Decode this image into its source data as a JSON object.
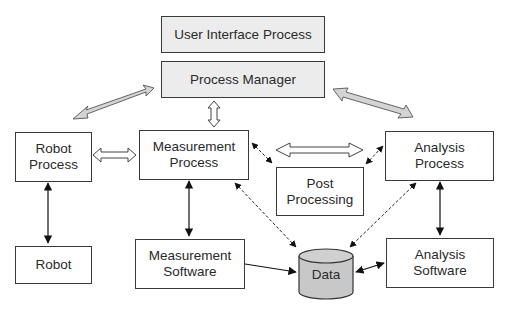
{
  "diagram": {
    "nodes": {
      "user_interface_process": "User Interface Process",
      "process_manager": "Process Manager",
      "robot_process": "Robot\nProcess",
      "measurement_process": "Measurement\nProcess",
      "post_processing": "Post\nProcessing",
      "analysis_process": "Analysis\nProcess",
      "robot": "Robot",
      "measurement_software": "Measurement\nSoftware",
      "analysis_software": "Analysis\nSoftware",
      "data": "Data"
    },
    "edges": [
      {
        "from": "process_manager",
        "to": "measurement_process",
        "style": "hollow-double-arrow"
      },
      {
        "from": "process_manager",
        "to": "robot_process",
        "style": "gray-double-arrow"
      },
      {
        "from": "process_manager",
        "to": "analysis_process",
        "style": "gray-double-arrow"
      },
      {
        "from": "robot_process",
        "to": "measurement_process",
        "style": "hollow-double-arrow"
      },
      {
        "from": "measurement_process",
        "to": "analysis_process",
        "style": "hollow-double-arrow"
      },
      {
        "from": "measurement_process",
        "to": "post_processing",
        "style": "dashed-bidirectional"
      },
      {
        "from": "post_processing",
        "to": "analysis_process",
        "style": "dashed-bidirectional"
      },
      {
        "from": "robot_process",
        "to": "robot",
        "style": "solid-bidirectional"
      },
      {
        "from": "measurement_process",
        "to": "measurement_software",
        "style": "solid-bidirectional"
      },
      {
        "from": "analysis_process",
        "to": "analysis_software",
        "style": "solid-bidirectional"
      },
      {
        "from": "measurement_software",
        "to": "data",
        "style": "solid-arrow"
      },
      {
        "from": "analysis_software",
        "to": "data",
        "style": "solid-bidirectional"
      },
      {
        "from": "measurement_process",
        "to": "data",
        "style": "dashed-bidirectional"
      },
      {
        "from": "analysis_process",
        "to": "data",
        "style": "dashed-bidirectional"
      }
    ],
    "colors": {
      "box_border": "#3a3a3a",
      "shaded_fill": "#ececec",
      "gray_arrow_fill": "#d4d4d4",
      "cylinder_fill": "#c8c8c8"
    }
  }
}
